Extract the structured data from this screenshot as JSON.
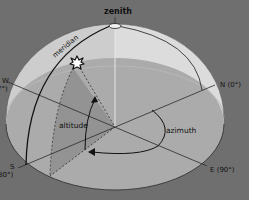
{
  "diagram": {
    "labels": {
      "zenith": "zenith",
      "meridian": "meridian",
      "altitude": "altitude",
      "azimuth": "azimuth",
      "north": "N (0°)",
      "east": "E (90°)",
      "south": "S",
      "south_deg": "80°)",
      "west": "W",
      "west_deg": "7°)"
    },
    "icons": {
      "star": "sun-star-icon"
    },
    "colors": {
      "background": "#6f6f6f",
      "dome_upper": "#c9c9c9",
      "dome_right": "#d8d8d8",
      "horizon_plane": "#a9a9a9",
      "altitude_wedge": "#8f8f8f",
      "line": "#222222"
    }
  }
}
